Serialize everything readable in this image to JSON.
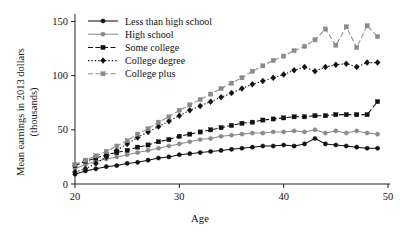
{
  "chart_data": {
    "type": "line",
    "title": "",
    "xlabel": "Age",
    "ylabel": "Mean earnings in 2013 dollars (thousands)",
    "ylabel_line1": "Mean earnings in 2013 dollars",
    "ylabel_line2": "(thousands)",
    "xlim": [
      20,
      50
    ],
    "ylim": [
      0,
      155
    ],
    "xticks": [
      20,
      30,
      40,
      50
    ],
    "xtick_labels": [
      "20",
      "30",
      "40",
      "50"
    ],
    "yticks": [
      0,
      50,
      100,
      150
    ],
    "ytick_labels": [
      "0",
      "50",
      "100",
      "150"
    ],
    "grid": false,
    "legend_position": "top-left-inside",
    "x": [
      20,
      21,
      22,
      23,
      24,
      25,
      26,
      27,
      28,
      29,
      30,
      31,
      32,
      33,
      34,
      35,
      36,
      37,
      38,
      39,
      40,
      41,
      42,
      43,
      44,
      45,
      46,
      47,
      48,
      49
    ],
    "series": [
      {
        "name": "Less than high school",
        "marker": "circle",
        "color": "#111111",
        "linestyle": "solid",
        "values": [
          9,
          12,
          14,
          16,
          17,
          19,
          20,
          22,
          24,
          25,
          27,
          28,
          29,
          30,
          31,
          32,
          33,
          34,
          35,
          35,
          36,
          35,
          37,
          42,
          37,
          36,
          35,
          34,
          33,
          33
        ]
      },
      {
        "name": "High school",
        "marker": "circle",
        "color": "#8a8a8a",
        "linestyle": "solid",
        "values": [
          14,
          18,
          21,
          23,
          25,
          27,
          29,
          31,
          33,
          35,
          37,
          39,
          41,
          42,
          44,
          45,
          46,
          47,
          47,
          48,
          48,
          49,
          48,
          50,
          47,
          49,
          47,
          49,
          47,
          46
        ]
      },
      {
        "name": "Some college",
        "marker": "square",
        "color": "#111111",
        "linestyle": "dashed",
        "values": [
          17,
          21,
          24,
          27,
          29,
          31,
          34,
          36,
          39,
          41,
          44,
          46,
          48,
          50,
          52,
          54,
          56,
          57,
          59,
          60,
          61,
          62,
          62,
          63,
          63,
          64,
          64,
          64,
          64,
          76
        ]
      },
      {
        "name": "College degree",
        "marker": "diamond",
        "color": "#111111",
        "linestyle": "dotted",
        "values": [
          11,
          14,
          19,
          25,
          31,
          37,
          43,
          48,
          53,
          58,
          63,
          68,
          72,
          76,
          80,
          84,
          88,
          92,
          95,
          98,
          101,
          105,
          108,
          104,
          108,
          110,
          111,
          108,
          112,
          112
        ]
      },
      {
        "name": "College plus",
        "marker": "square",
        "color": "#8a8a8a",
        "linestyle": "dashed",
        "values": [
          18,
          22,
          26,
          30,
          35,
          40,
          46,
          51,
          57,
          62,
          68,
          73,
          78,
          83,
          88,
          93,
          98,
          104,
          109,
          114,
          118,
          123,
          127,
          133,
          143,
          128,
          145,
          126,
          146,
          136
        ]
      }
    ]
  }
}
